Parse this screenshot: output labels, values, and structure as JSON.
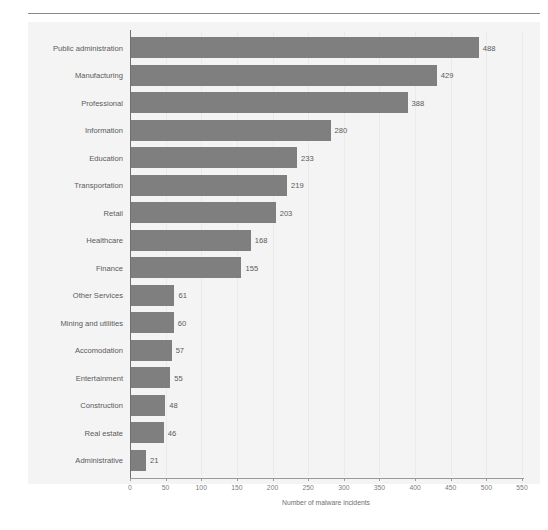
{
  "header": {
    "running_head": "",
    "rule_color": "#8a8a8a"
  },
  "figure": {
    "caption": ""
  },
  "chart_data": {
    "type": "bar",
    "orientation": "horizontal",
    "title": "",
    "subtitle": "",
    "xlabel": "Number of malware incidents",
    "ylabel": "",
    "xlim": [
      0,
      550
    ],
    "xticks": [
      0,
      50,
      100,
      150,
      200,
      250,
      300,
      350,
      400,
      450,
      500,
      550
    ],
    "xtick_labels": [
      "0",
      "50",
      "100",
      "150",
      "200",
      "250",
      "300",
      "350",
      "400",
      "450",
      "500",
      "550"
    ],
    "grid": "vertical",
    "legend": "none",
    "bar_color": "#7f7f7f",
    "plot_background": "#f4f4f4",
    "categories": [
      "Public administration",
      "Manufacturing",
      "Professional",
      "Information",
      "Education",
      "Transportation",
      "Retail",
      "Healthcare",
      "Finance",
      "Other Services",
      "Mining and utilities",
      "Accomodation",
      "Entertainment",
      "Construction",
      "Real estate",
      "Administrative"
    ],
    "values": [
      488,
      429,
      388,
      280,
      233,
      219,
      203,
      168,
      155,
      61,
      60,
      57,
      55,
      48,
      46,
      21
    ],
    "data_labels": [
      "488",
      "429",
      "388",
      "280",
      "233",
      "219",
      "203",
      "168",
      "155",
      "61",
      "60",
      "57",
      "55",
      "48",
      "46",
      "21"
    ]
  }
}
